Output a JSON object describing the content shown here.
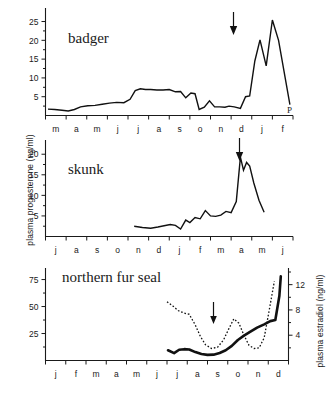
{
  "figure": {
    "axis_labels": {
      "y_left": "plasma progesterone (ng/ml)",
      "y_right": "plasma estradiol (ng/ml)"
    }
  },
  "chart_data": [
    {
      "type": "line",
      "title": "badger",
      "panel": "top",
      "xlabel": "",
      "ylabel": "plasma progesterone (ng/ml)",
      "ylim": [
        0,
        27
      ],
      "yticks": [
        5,
        10,
        15,
        20,
        25
      ],
      "xlim": [
        0,
        12
      ],
      "tick_labels": [
        "m",
        "a",
        "m",
        "j",
        "j",
        "a",
        "s",
        "o",
        "n",
        "d",
        "j",
        "f"
      ],
      "grid": false,
      "legend": "none",
      "annotations": [
        {
          "label": "arrow-down",
          "x": 8.75,
          "y": 24.5,
          "note": "downward arrow marking onset of implantation"
        },
        {
          "label": "P",
          "x": 11.9,
          "y": 2.2,
          "note": "P marker at curve terminus"
        }
      ],
      "series": [
        {
          "name": "progesterone",
          "style": "solid",
          "x": [
            0.12,
            0.45,
            0.8,
            1.1,
            1.4,
            1.7,
            2.05,
            2.4,
            2.75,
            3.1,
            3.45,
            3.8,
            4.1,
            4.35,
            4.6,
            4.85,
            5.1,
            5.4,
            5.7,
            6.0,
            6.3,
            6.55,
            6.8,
            7.05,
            7.25,
            7.45,
            7.7,
            7.95,
            8.2,
            8.45,
            8.7,
            8.9,
            9.15,
            9.45,
            9.7,
            9.9,
            10.15,
            10.4,
            10.7,
            11.0,
            11.3,
            11.85
          ],
          "y": [
            1.7,
            1.6,
            1.4,
            1.2,
            1.6,
            2.3,
            2.6,
            2.7,
            3.0,
            3.3,
            3.5,
            3.4,
            4.3,
            6.6,
            7.1,
            6.9,
            6.9,
            6.8,
            6.8,
            6.9,
            6.3,
            6.4,
            4.7,
            6.0,
            5.8,
            1.6,
            2.2,
            3.9,
            2.3,
            2.3,
            2.2,
            2.5,
            2.3,
            1.9,
            5.0,
            5.2,
            14.5,
            20.1,
            13.2,
            25.4,
            20.0,
            2.9
          ]
        }
      ]
    },
    {
      "type": "line",
      "title": "skunk",
      "panel": "middle",
      "xlabel": "",
      "ylabel": "plasma progesterone (ng/ml)",
      "ylim": [
        0,
        22
      ],
      "yticks": [
        5,
        10,
        15,
        20
      ],
      "xlim": [
        0,
        12
      ],
      "tick_labels": [
        "j",
        "a",
        "s",
        "o",
        "n",
        "d",
        "j",
        "f",
        "m",
        "a",
        "m",
        "j"
      ],
      "grid": false,
      "legend": "none",
      "annotations": [
        {
          "label": "arrow-down",
          "x": 9.55,
          "y": 20.5,
          "note": "downward arrow marking onset of implantation"
        }
      ],
      "series": [
        {
          "name": "progesterone",
          "style": "solid",
          "x": [
            4.3,
            4.7,
            5.1,
            5.45,
            5.75,
            6.05,
            6.3,
            6.55,
            6.8,
            7.0,
            7.25,
            7.5,
            7.75,
            8.0,
            8.25,
            8.5,
            8.75,
            9.0,
            9.25,
            9.45,
            9.6,
            9.75,
            9.9,
            10.1,
            10.35,
            10.6
          ],
          "y": [
            2.5,
            2.2,
            2.0,
            2.3,
            2.6,
            2.9,
            2.7,
            1.8,
            4.0,
            3.4,
            4.6,
            4.3,
            6.3,
            5.0,
            4.9,
            5.2,
            6.1,
            5.8,
            8.5,
            19.3,
            16.1,
            18.0,
            17.1,
            13.0,
            8.8,
            5.9
          ]
        }
      ]
    },
    {
      "type": "line",
      "title": "northern fur seal",
      "panel": "bottom",
      "xlabel": "",
      "ylabel": "plasma progesterone (ng/ml)",
      "ylabel_right": "plasma estradiol (ng/ml)",
      "ylim": [
        0,
        82
      ],
      "yticks": [
        25,
        50,
        75
      ],
      "ylim_right": [
        0,
        14
      ],
      "yticks_right": [
        4,
        8,
        12
      ],
      "xlim": [
        0,
        12
      ],
      "tick_labels": [
        "j",
        "f",
        "m",
        "a",
        "m",
        "j",
        "j",
        "a",
        "s",
        "o",
        "n",
        "d"
      ],
      "grid": false,
      "legend": "none",
      "annotations": [
        {
          "label": "arrow-down",
          "x": 9.25,
          "y": 30.0,
          "note": "downward arrow marking onset of implantation"
        }
      ],
      "series": [
        {
          "name": "progesterone",
          "style": "solid-thick",
          "axis": "left",
          "x": [
            6.05,
            6.35,
            6.6,
            6.85,
            7.1,
            7.4,
            7.7,
            8.0,
            8.3,
            8.6,
            8.9,
            9.2,
            9.5,
            9.8,
            10.1,
            10.45,
            10.8,
            11.1,
            11.35,
            11.55,
            11.62
          ],
          "y": [
            9.5,
            6.8,
            10.0,
            10.5,
            10.2,
            7.8,
            6.0,
            5.2,
            5.4,
            7.0,
            9.5,
            13.5,
            19.0,
            23.0,
            26.5,
            30.5,
            33.5,
            36.5,
            37.5,
            60.0,
            78.0
          ]
        },
        {
          "name": "estradiol",
          "style": "dotted",
          "axis": "right",
          "x": [
            6.0,
            6.3,
            6.55,
            6.85,
            7.1,
            7.4,
            7.65,
            7.9,
            8.2,
            8.5,
            8.8,
            9.05,
            9.3,
            9.55,
            9.8,
            10.05,
            10.3,
            10.55,
            10.8,
            11.05,
            11.3
          ],
          "y": [
            9.3,
            8.6,
            7.9,
            7.5,
            7.3,
            5.6,
            3.8,
            2.5,
            1.9,
            2.1,
            3.3,
            5.0,
            6.6,
            5.9,
            4.0,
            2.4,
            1.9,
            2.0,
            3.6,
            8.0,
            12.5
          ]
        }
      ]
    }
  ]
}
